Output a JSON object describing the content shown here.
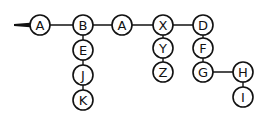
{
  "diagram": {
    "type": "tree",
    "colors": {
      "stroke": "#111111",
      "fill": "#ffffff"
    },
    "entry_arrow": {
      "x1": 14,
      "y": 25,
      "x2": 30
    },
    "nodes": [
      {
        "id": "n1",
        "label": "A",
        "x": 40,
        "y": 25
      },
      {
        "id": "n2",
        "label": "B",
        "x": 83,
        "y": 25
      },
      {
        "id": "n3",
        "label": "E",
        "x": 83,
        "y": 50
      },
      {
        "id": "n4",
        "label": "J",
        "x": 83,
        "y": 75
      },
      {
        "id": "n5",
        "label": "K",
        "x": 83,
        "y": 100
      },
      {
        "id": "n6",
        "label": "A",
        "x": 122,
        "y": 25
      },
      {
        "id": "n7",
        "label": "X",
        "x": 163,
        "y": 25
      },
      {
        "id": "n8",
        "label": "Y",
        "x": 163,
        "y": 48
      },
      {
        "id": "n9",
        "label": "Z",
        "x": 163,
        "y": 72
      },
      {
        "id": "n10",
        "label": "D",
        "x": 203,
        "y": 25
      },
      {
        "id": "n11",
        "label": "F",
        "x": 203,
        "y": 48
      },
      {
        "id": "n12",
        "label": "G",
        "x": 203,
        "y": 72
      },
      {
        "id": "n13",
        "label": "H",
        "x": 243,
        "y": 72
      },
      {
        "id": "n14",
        "label": "I",
        "x": 243,
        "y": 97
      }
    ],
    "edges": [
      [
        "n1",
        "n2"
      ],
      [
        "n2",
        "n6"
      ],
      [
        "n6",
        "n7"
      ],
      [
        "n7",
        "n10"
      ],
      [
        "n2",
        "n3"
      ],
      [
        "n3",
        "n4"
      ],
      [
        "n4",
        "n5"
      ],
      [
        "n7",
        "n8"
      ],
      [
        "n8",
        "n9"
      ],
      [
        "n10",
        "n11"
      ],
      [
        "n11",
        "n12"
      ],
      [
        "n12",
        "n13"
      ],
      [
        "n13",
        "n14"
      ]
    ],
    "node_radius": 10
  }
}
